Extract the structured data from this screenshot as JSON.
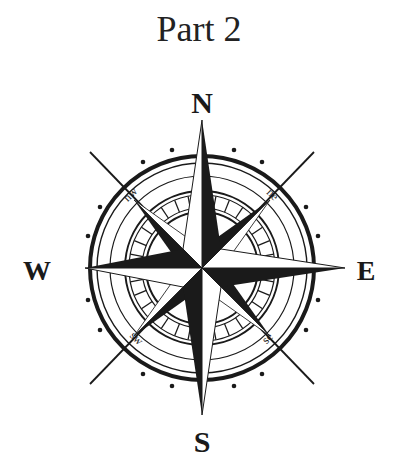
{
  "title": "Part 2",
  "compass": {
    "cardinals": {
      "north": "N",
      "south": "S",
      "east": "E",
      "west": "W"
    },
    "intercardinals": {
      "northwest": "nw",
      "northeast": "ne",
      "southwest": "sw",
      "southeast": "se"
    },
    "ink_color": "#1a1a1a",
    "background_color": "#ffffff"
  }
}
